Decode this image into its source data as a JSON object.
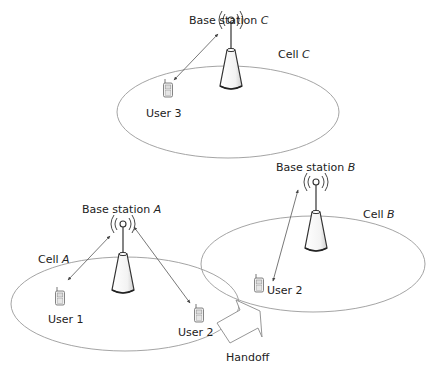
{
  "diagram": {
    "colors": {
      "line": "#555555",
      "cell": "#9a9a9a",
      "text": "#222222",
      "background": "#ffffff"
    },
    "cells": [
      {
        "id": "C",
        "label_prefix": "Cell ",
        "label_var": "C",
        "station_prefix": "Base station ",
        "station_var": "C"
      },
      {
        "id": "A",
        "label_prefix": "Cell ",
        "label_var": "A",
        "station_prefix": "Base station ",
        "station_var": "A"
      },
      {
        "id": "B",
        "label_prefix": "Cell ",
        "label_var": "B",
        "station_prefix": "Base station ",
        "station_var": "B"
      }
    ],
    "users": [
      {
        "label": "User 3",
        "cell": "C"
      },
      {
        "label": "User 1",
        "cell": "A"
      },
      {
        "label": "User 2",
        "cell": "A"
      },
      {
        "label": "User 2",
        "cell": "B"
      }
    ],
    "handoff": {
      "label": "Handoff"
    }
  }
}
